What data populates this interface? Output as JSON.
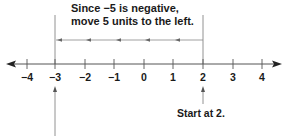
{
  "caption": {
    "line1": "Since −5 is negative,",
    "line2": "move 5 units to the left."
  },
  "start_label": "Start at 2.",
  "number_line": {
    "ticks": [
      "−4",
      "−3",
      "−2",
      "−1",
      "0",
      "1",
      "2",
      "3",
      "4"
    ],
    "start_value": 2,
    "end_value": -3,
    "move_units": 5,
    "direction": "left"
  },
  "colors": {
    "line": "#555555",
    "text": "#1a1a1a"
  }
}
